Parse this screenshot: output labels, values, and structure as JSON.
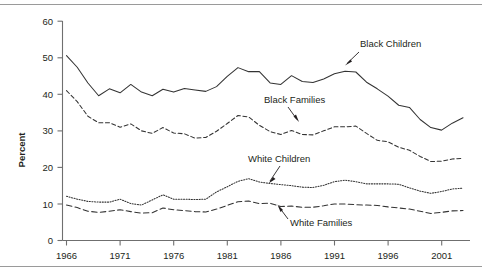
{
  "chart_data": {
    "type": "line",
    "title": "",
    "subtitle": "",
    "xlabel": "",
    "ylabel": "Percent",
    "xlim": [
      1966,
      2003
    ],
    "ylim": [
      0,
      60
    ],
    "grid": false,
    "legend_position": "inline-annotations",
    "xticks": [
      "1966",
      "1971",
      "1976",
      "1981",
      "1986",
      "1991",
      "1996",
      "2001"
    ],
    "xtick_values": [
      1966,
      1971,
      1976,
      1981,
      1986,
      1991,
      1996,
      2001
    ],
    "yticks": [
      "0",
      "10",
      "20",
      "30",
      "40",
      "50",
      "60"
    ],
    "ytick_values": [
      0,
      10,
      20,
      30,
      40,
      50,
      60
    ],
    "x": [
      1966,
      1967,
      1968,
      1969,
      1970,
      1971,
      1972,
      1973,
      1974,
      1975,
      1976,
      1977,
      1978,
      1979,
      1980,
      1981,
      1982,
      1983,
      1984,
      1985,
      1986,
      1987,
      1988,
      1989,
      1990,
      1991,
      1992,
      1993,
      1994,
      1995,
      1996,
      1997,
      1998,
      1999,
      2000,
      2001,
      2002,
      2003
    ],
    "series": [
      {
        "name": "Black Children",
        "style": "solid",
        "values": [
          50.6,
          47.4,
          43.1,
          39.6,
          41.5,
          40.4,
          42.7,
          40.6,
          39.6,
          41.4,
          40.6,
          41.6,
          41.2,
          40.8,
          42.1,
          44.9,
          47.3,
          46.2,
          46.2,
          43.1,
          42.7,
          45.1,
          43.5,
          43.2,
          44.2,
          45.6,
          46.3,
          46.1,
          43.3,
          41.5,
          39.5,
          37.0,
          36.4,
          33.1,
          30.9,
          30.2,
          32.1,
          33.6
        ]
      },
      {
        "name": "Black Families",
        "style": "dashed",
        "values": [
          41.0,
          38.0,
          34.0,
          32.2,
          32.2,
          31.0,
          31.9,
          30.0,
          29.3,
          30.9,
          29.4,
          29.2,
          28.0,
          28.2,
          29.9,
          32.0,
          34.2,
          33.8,
          31.5,
          29.8,
          29.0,
          30.1,
          29.0,
          28.9,
          30.0,
          31.1,
          31.1,
          31.3,
          29.3,
          27.4,
          27.0,
          25.5,
          24.7,
          23.0,
          21.6,
          21.7,
          22.3,
          22.5
        ]
      },
      {
        "name": "White Children",
        "style": "dotted",
        "values": [
          12.1,
          11.3,
          10.7,
          10.5,
          10.5,
          11.3,
          10.1,
          9.7,
          11.1,
          12.5,
          11.3,
          11.3,
          11.2,
          11.3,
          13.3,
          14.7,
          16.2,
          16.9,
          16.0,
          15.6,
          15.3,
          15.0,
          14.6,
          14.5,
          15.1,
          16.1,
          16.5,
          16.1,
          15.5,
          15.5,
          15.5,
          15.4,
          14.4,
          13.5,
          12.9,
          13.4,
          14.1,
          14.3
        ]
      },
      {
        "name": "White Families",
        "style": "dashed-thick",
        "values": [
          9.7,
          9.0,
          8.0,
          7.7,
          8.0,
          8.4,
          7.9,
          7.5,
          7.6,
          8.9,
          8.4,
          8.2,
          7.9,
          7.8,
          8.6,
          9.6,
          10.6,
          10.8,
          10.1,
          10.2,
          9.3,
          9.4,
          9.1,
          9.1,
          9.5,
          10.0,
          10.0,
          9.8,
          9.7,
          9.6,
          9.2,
          8.9,
          8.6,
          8.0,
          7.4,
          7.7,
          8.1,
          8.2
        ]
      }
    ],
    "annotations": [
      {
        "text": "Black Children",
        "series": "Black Children"
      },
      {
        "text": "Black Families",
        "series": "Black Families"
      },
      {
        "text": "White Children",
        "series": "White Children"
      },
      {
        "text": "White Families",
        "series": "White Families"
      }
    ],
    "colors": {
      "line": "#333333",
      "axis": "#6f6f6f",
      "text": "#231f20",
      "rule": "#9a9a9a",
      "background": "#ffffff"
    }
  }
}
